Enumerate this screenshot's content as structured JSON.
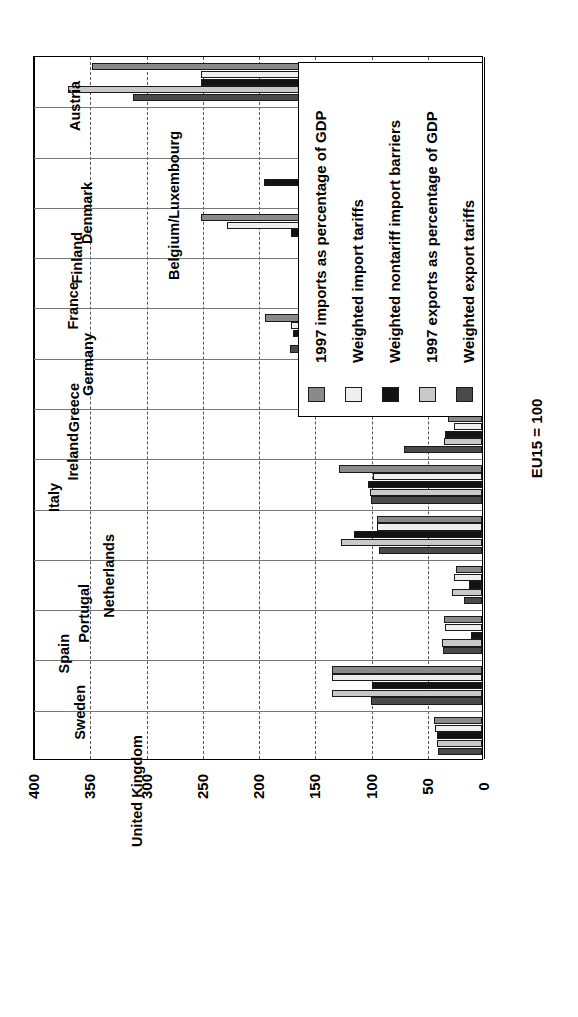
{
  "chart_data": {
    "type": "bar",
    "orientation": "rotated-90",
    "title": "",
    "xlabel": "",
    "ylabel": "EU15 = 100",
    "ylim": [
      0,
      400
    ],
    "yticks": [
      0,
      50,
      100,
      150,
      200,
      250,
      300,
      350,
      400
    ],
    "grid": true,
    "legend_position": "upper-right",
    "categories": [
      "Austria",
      "Belgium/Luxembourg",
      "Denmark",
      "Finland",
      "France",
      "Germany",
      "Greece",
      "Ireland",
      "Italy",
      "Netherlands",
      "Portugal",
      "Spain",
      "Sweden",
      "United Kingdom"
    ],
    "series": [
      {
        "name": "1997 imports as percentage of GDP",
        "color": "#8a8a8a",
        "values": [
          347,
          100,
          99,
          250,
          45,
          193,
          146,
          30,
          127,
          93,
          23,
          34,
          133,
          43
        ]
      },
      {
        "name": "Weighted import tariffs",
        "color": "#efefef",
        "values": [
          250,
          125,
          97,
          227,
          43,
          170,
          85,
          25,
          97,
          93,
          25,
          33,
          133,
          42
        ]
      },
      {
        "name": "Weighted nontariff import barriers",
        "color": "#121212",
        "values": [
          250,
          83,
          194,
          170,
          46,
          168,
          78,
          33,
          101,
          114,
          12,
          10,
          98,
          40
        ]
      },
      {
        "name": "1997 exports as percentage of GDP",
        "color": "#c9c9c9",
        "values": [
          368,
          143,
          99,
          120,
          53,
          157,
          146,
          34,
          100,
          125,
          27,
          36,
          133,
          40
        ]
      },
      {
        "name": "Weighted export tariffs",
        "color": "#4a4a4a",
        "values": [
          310,
          98,
          98,
          119,
          41,
          171,
          79,
          69,
          99,
          92,
          16,
          35,
          99,
          39
        ]
      }
    ]
  },
  "legend": {
    "entries": [
      "1997 imports as percentage of GDP",
      "Weighted import tariffs",
      "Weighted nontariff import barriers",
      "1997 exports as percentage of GDP",
      "Weighted export tariffs"
    ]
  },
  "axis": {
    "value_title": "EU15 = 100",
    "ticks": [
      "0",
      "50",
      "100",
      "150",
      "200",
      "250",
      "300",
      "350",
      "400"
    ]
  }
}
